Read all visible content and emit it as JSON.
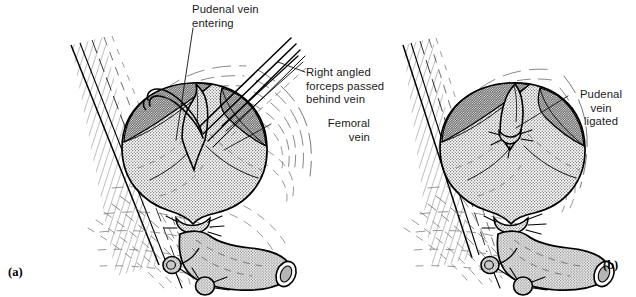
{
  "figure": {
    "kind": "surgical-line-illustration",
    "background_color": "#ffffff",
    "ink_color": "#000000",
    "stipple_color": "#6f6f6f",
    "shadow_fill": "#9a9a9a",
    "panel_count": 2
  },
  "labels": {
    "pudenal_entering": "Pudenal vein\nentering",
    "forceps": "Right angled\nforceps passed\nbehind vein",
    "femoral_vein": "Femoral\nvein",
    "pudenal_ligated": "Pudenal\nvein\nligated"
  },
  "panels": [
    {
      "id": "a",
      "letter": "(a)",
      "caption_labels": [
        "pudenal_entering",
        "forceps",
        "femoral_vein"
      ]
    },
    {
      "id": "b",
      "letter": "(b)",
      "caption_labels": [
        "pudenal_ligated"
      ]
    }
  ]
}
